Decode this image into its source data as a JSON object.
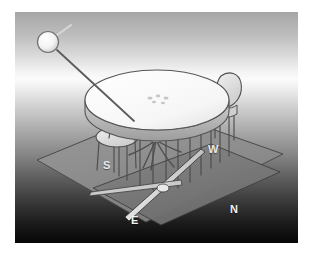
{
  "image": {
    "title": "Sun and table shadow projection diagram",
    "kind": "3d-rendered-illustration",
    "palette": "grayscale",
    "canvas": {
      "width": 311,
      "height": 255
    },
    "frame": {
      "x": 15,
      "y": 12,
      "width": 283,
      "height": 231
    },
    "border_color": "#ffffff",
    "background": {
      "type": "vertical-gradient",
      "top_color": "#a6a6a6",
      "highlight_color": "#fbfbfb",
      "bottom_color": "#060606"
    }
  },
  "compass": {
    "labels": [
      {
        "id": "south",
        "text": "S",
        "color": "#e8e8e8"
      },
      {
        "id": "west",
        "text": "W",
        "color": "#e8e8e8"
      },
      {
        "id": "north",
        "text": "N",
        "color": "#f0f0f0"
      },
      {
        "id": "east",
        "text": "E",
        "color": "#f2f2f2"
      }
    ]
  },
  "objects": {
    "sun": {
      "name": "light-source-sphere",
      "fill": "#f3f3f3",
      "stroke": "#6d6d6d",
      "center": {
        "x": 34,
        "y": 30
      },
      "radius": 10
    },
    "sun_ray": {
      "name": "sun-ray-rod",
      "color": "#5c5c5c",
      "from": {
        "x": 42,
        "y": 38
      },
      "to": {
        "x": 118,
        "y": 108
      }
    },
    "sun_tick": {
      "name": "sun-axis-tick",
      "color": "#c9c9c9"
    },
    "ground_plane": {
      "name": "ground-plane",
      "fill": "#8f8f8f",
      "stroke": "#4a4a4a"
    },
    "shadow_plane": {
      "name": "shadow-plane",
      "fill": "#7b7b7b",
      "stroke": "#3d3d3d"
    },
    "table": {
      "name": "round-table",
      "top_fill": "#fbfbfb",
      "edge_fill": "#b5b5b5",
      "stroke": "#555555",
      "items_on_top": 5
    },
    "chairs": {
      "name": "chairs",
      "count": 3,
      "fill": "#e2e2e2",
      "stroke": "#4f4f4f"
    },
    "gnomon": {
      "name": "gnomon-bar",
      "fill": "#e6e6e6",
      "stroke": "#3a3a3a"
    },
    "projection_rays": {
      "name": "vertical-projection-lines",
      "color": "#4c4c4c",
      "count": 11
    }
  }
}
